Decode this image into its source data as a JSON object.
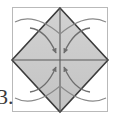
{
  "figure": {
    "kind": "origami-fold-diagram",
    "step_label": "3.",
    "canvas": {
      "width": 115,
      "height": 118
    },
    "colors": {
      "background": "#ffffff",
      "paper_fill": "#c9c9c9",
      "paper_fill_light": "#d4d4d4",
      "outline": "#3c3c3c",
      "frame_line": "#b9b9b9",
      "crease_line": "#5a5a5a",
      "arrow": "#6e6e6e",
      "motion_arc": "#8a8a8a",
      "label_text": "#3a3a3a"
    },
    "square_frame": {
      "name": "outer-square-sheet",
      "x": 12,
      "y": 7,
      "width": 96,
      "height": 105,
      "stroke": "#b9b9b9",
      "fill": "#ffffff"
    },
    "diamond": {
      "name": "inscribed-diamond",
      "vertices": [
        {
          "label": "top",
          "x": 60,
          "y": 8
        },
        {
          "label": "right",
          "x": 108,
          "y": 60
        },
        {
          "label": "bottom",
          "x": 60,
          "y": 112
        },
        {
          "label": "left",
          "x": 12,
          "y": 60
        }
      ],
      "fill": "#c9c9c9",
      "stroke": "#3c3c3c",
      "stroke_width": 1.6
    },
    "center_point": {
      "x": 60,
      "y": 60
    },
    "creases": [
      {
        "name": "crease-vertical",
        "x1": 60,
        "y1": 8,
        "x2": 60,
        "y2": 112
      },
      {
        "name": "crease-horizontal",
        "x1": 12,
        "y1": 60,
        "x2": 108,
        "y2": 60
      }
    ],
    "fold_arrows": [
      {
        "name": "fold-arrow-top-left",
        "from_x": 30,
        "from_y": 28,
        "ctrl_x": 46,
        "ctrl_y": 30,
        "to_x": 56,
        "to_y": 53,
        "direction": "to-center"
      },
      {
        "name": "fold-arrow-top-right",
        "from_x": 90,
        "from_y": 28,
        "ctrl_x": 74,
        "ctrl_y": 30,
        "to_x": 64,
        "to_y": 53,
        "direction": "to-center"
      },
      {
        "name": "fold-arrow-bottom-left",
        "from_x": 30,
        "from_y": 92,
        "ctrl_x": 46,
        "ctrl_y": 90,
        "to_x": 56,
        "to_y": 67,
        "direction": "to-center"
      },
      {
        "name": "fold-arrow-bottom-right",
        "from_x": 90,
        "from_y": 92,
        "ctrl_x": 74,
        "ctrl_y": 90,
        "to_x": 64,
        "to_y": 67,
        "direction": "to-center"
      }
    ],
    "motion_arcs": [
      {
        "name": "motion-arc-top-left",
        "d": "M 15 22 Q 34 12 60 34"
      },
      {
        "name": "motion-arc-top-right",
        "d": "M 106 22 Q 86 12 60 34"
      },
      {
        "name": "motion-arc-bottom-left",
        "d": "M 15 98 Q 34 108 60 86"
      },
      {
        "name": "motion-arc-bottom-right",
        "d": "M 106 98 Q 86 108 60 86"
      }
    ]
  }
}
